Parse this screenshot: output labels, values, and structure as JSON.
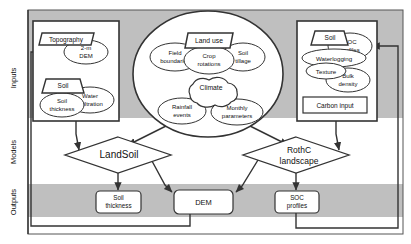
{
  "figure": {
    "band_color_shaded": "#bfbfbf",
    "band_color_plain": "#ffffff",
    "line_color": "#333333",
    "shape_fill": "#ffffff"
  },
  "rows": [
    {
      "key": "inputs",
      "label": "Inputs"
    },
    {
      "key": "models",
      "label": "Models"
    },
    {
      "key": "outputs",
      "label": "Outputs"
    }
  ],
  "inputs": {
    "left_box": {
      "name": "topography-soil-inputs",
      "nodes": [
        {
          "id": "topography",
          "label": "Topography",
          "shape": "parallelogram"
        },
        {
          "id": "dem-2m",
          "label": "2-m\nDEM",
          "shape": "ellipse"
        },
        {
          "id": "soil-left",
          "label": "Soil",
          "shape": "trapezoid"
        },
        {
          "id": "soil-thickness",
          "label": "Soil\nthickness",
          "shape": "ellipse"
        },
        {
          "id": "water-infiltration",
          "label": "Water\ninfiltration",
          "shape": "ellipse"
        }
      ]
    },
    "center_group": {
      "name": "land-use-climate-inputs",
      "shape": "ellipse",
      "nodes": [
        {
          "id": "land-use",
          "label": "Land use",
          "shape": "parallelogram"
        },
        {
          "id": "field-boundaries",
          "label": "Field\nboundaries",
          "shape": "ellipse"
        },
        {
          "id": "crop-rotations",
          "label": "Crop\nrotations",
          "shape": "ellipse"
        },
        {
          "id": "soil-tillage",
          "label": "Soil\ntillage",
          "shape": "ellipse"
        },
        {
          "id": "climate",
          "label": "Climate",
          "shape": "cloud"
        },
        {
          "id": "rainfall-events",
          "label": "Rainfall\nevents",
          "shape": "ellipse"
        },
        {
          "id": "monthly-parameters",
          "label": "Monthly\nparameters",
          "shape": "ellipse"
        }
      ]
    },
    "right_box": {
      "name": "soil-carbon-inputs",
      "nodes": [
        {
          "id": "soil-right",
          "label": "Soil",
          "shape": "trapezoid"
        },
        {
          "id": "soc-profiles-in",
          "label": "SOC\nprofiles",
          "shape": "ellipse"
        },
        {
          "id": "waterlogging",
          "label": "Waterlogging",
          "shape": "ellipse"
        },
        {
          "id": "texture",
          "label": "Texture",
          "shape": "ellipse"
        },
        {
          "id": "bulk-density",
          "label": "Bulk\ndensity",
          "shape": "ellipse"
        },
        {
          "id": "carbon-input",
          "label": "Carbon input",
          "shape": "rectangle"
        }
      ]
    }
  },
  "models": [
    {
      "id": "landsoil",
      "label": "LandSoil",
      "shape": "diamond"
    },
    {
      "id": "rothc-landscape",
      "label": "RothC\nlandscape",
      "shape": "diamond"
    }
  ],
  "outputs": [
    {
      "id": "soil-thickness-out",
      "label": "Soil\nthickness",
      "shape": "rounded-rectangle"
    },
    {
      "id": "dem-out",
      "label": "DEM",
      "shape": "rounded-rectangle"
    },
    {
      "id": "soc-profiles-out",
      "label": "SOC\nprofiles",
      "shape": "rounded-rectangle"
    }
  ],
  "text": {
    "topography": "Topography",
    "dem_2m_l1": "2-m",
    "dem_2m_l2": "DEM",
    "soil_left": "Soil",
    "soil_thickness_l1": "Soil",
    "soil_thickness_l2": "thickness",
    "water_infiltration_l1": "Water",
    "water_infiltration_l2": "infiltration",
    "land_use": "Land use",
    "field_boundaries_l1": "Field",
    "field_boundaries_l2": "boundaries",
    "crop_rotations_l1": "Crop",
    "crop_rotations_l2": "rotations",
    "soil_tillage_l1": "Soil",
    "soil_tillage_l2": "tillage",
    "climate": "Climate",
    "rainfall_events_l1": "Rainfall",
    "rainfall_events_l2": "events",
    "monthly_parameters_l1": "Monthly",
    "monthly_parameters_l2": "parameters",
    "soil_right": "Soil",
    "soc_profiles_in_l1": "SOC",
    "soc_profiles_in_l2": "profiles",
    "waterlogging": "Waterlogging",
    "texture": "Texture",
    "bulk_density_l1": "Bulk",
    "bulk_density_l2": "density",
    "carbon_input": "Carbon input",
    "landsoil": "LandSoil",
    "rothc_l1": "RothC",
    "rothc_l2": "landscape",
    "soil_thickness_out_l1": "Soil",
    "soil_thickness_out_l2": "thickness",
    "dem_out": "DEM",
    "soc_profiles_out_l1": "SOC",
    "soc_profiles_out_l2": "profiles",
    "row_inputs": "Inputs",
    "row_models": "Models",
    "row_outputs": "Outputs"
  }
}
